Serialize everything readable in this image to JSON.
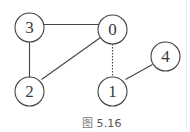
{
  "figure": {
    "caption_prefix": "图",
    "caption_number": "5.16",
    "colors": {
      "stroke": "#444444",
      "label": "#3a3a3a",
      "caption": "#555555",
      "background": "#ffffff"
    }
  },
  "graph": {
    "nodes": [
      {
        "id": "0",
        "label": "0",
        "cx": 112.5,
        "cy": 29.5,
        "r": 14.5
      },
      {
        "id": "1",
        "label": "1",
        "cx": 112.5,
        "cy": 91.5,
        "r": 14.5
      },
      {
        "id": "2",
        "label": "2",
        "cx": 29.5,
        "cy": 91.5,
        "r": 14.5
      },
      {
        "id": "3",
        "label": "3",
        "cx": 29.5,
        "cy": 27.5,
        "r": 14.5
      },
      {
        "id": "4",
        "label": "4",
        "cx": 165.5,
        "cy": 56.5,
        "r": 14.5
      }
    ],
    "edges": [
      {
        "from": "3",
        "to": "0",
        "style": "solid"
      },
      {
        "from": "3",
        "to": "2",
        "style": "solid"
      },
      {
        "from": "0",
        "to": "2",
        "style": "solid"
      },
      {
        "from": "0",
        "to": "1",
        "style": "dotted"
      },
      {
        "from": "1",
        "to": "4",
        "style": "solid"
      }
    ]
  },
  "labels": {
    "node_0": "0",
    "node_1": "1",
    "node_2": "2",
    "node_3": "3",
    "node_4": "4"
  }
}
